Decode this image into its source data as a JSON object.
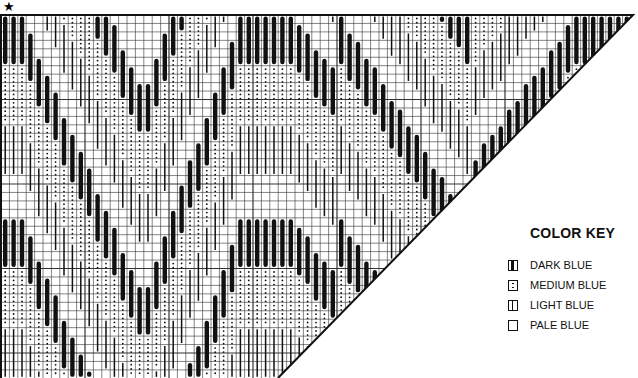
{
  "chart_marker": "★",
  "color_key": {
    "title": "COLOR KEY",
    "items": [
      {
        "symbol": "dark",
        "label": "DARK BLUE"
      },
      {
        "symbol": "medium",
        "label": "MEDIUM BLUE"
      },
      {
        "symbol": "light",
        "label": "LIGHT BLUE"
      },
      {
        "symbol": "pale",
        "label": "PALE BLUE"
      }
    ]
  },
  "chart_data": {
    "type": "table",
    "grid": {
      "columns": 75,
      "rows": 43,
      "column_width_px": 8.4,
      "row_height_px": 8.45
    },
    "shape": "right trapezoid with diagonal cut from bottom-center to top-right",
    "legend": [
      "DARK BLUE",
      "MEDIUM BLUE",
      "LIGHT BLUE",
      "PALE BLUE"
    ],
    "pattern": "stepped chevron waves descending from top-left, V valley around column 16-17, rising to right, stitch colors cycle dark→medium→light→pale"
  },
  "colors": {
    "ink": "#111111",
    "grid": "#222222",
    "background": "#ffffff"
  }
}
